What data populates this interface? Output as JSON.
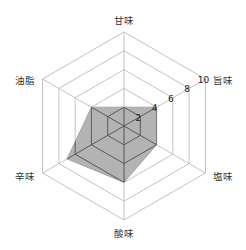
{
  "chart_data": {
    "type": "radar",
    "title": "",
    "categories": [
      "甘味",
      "旨味",
      "塩味",
      "酸味",
      "辛味",
      "油脂"
    ],
    "values": [
      2,
      4,
      4,
      6,
      7,
      4
    ],
    "rlim": [
      0,
      10
    ],
    "ticks": [
      "2",
      "4",
      "6",
      "8",
      "10"
    ],
    "tick_values": [
      2,
      4,
      6,
      8,
      10
    ],
    "grid": true,
    "legend": null,
    "colors": {
      "grid": "#bbbbbb",
      "fill": "#999999",
      "fill_opacity": 0.75,
      "stroke": "#999999",
      "inner_grid_over_fill": "#555555"
    }
  }
}
